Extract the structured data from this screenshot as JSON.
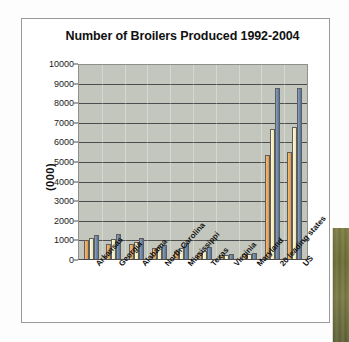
{
  "chart_data": {
    "type": "bar",
    "title": "Number of Broilers Produced 1992-2004",
    "xlabel": "",
    "ylabel": "(000)",
    "ylim": [
      0,
      10000
    ],
    "yticks": [
      0,
      1000,
      2000,
      3000,
      4000,
      5000,
      6000,
      7000,
      8000,
      9000,
      10000
    ],
    "ytick_labels": [
      "0",
      "1000",
      "2000",
      "3000",
      "4000",
      "5000",
      "6000",
      "7000",
      "8000",
      "9000",
      "10000"
    ],
    "grid": true,
    "legend": false,
    "legend_position": "none",
    "categories": [
      "Arkansas",
      "Georgia",
      "Alabama",
      "North Carolina",
      "Mississippi",
      "Texas",
      "Virginia",
      "Maryland",
      "20 leading states",
      "US"
    ],
    "series": [
      {
        "name": "1992",
        "color": "#e9a75c",
        "values": [
          950,
          780,
          760,
          540,
          420,
          310,
          190,
          240,
          5330,
          5450
        ]
      },
      {
        "name": "1998",
        "color": "#f4efc2",
        "values": [
          1060,
          1020,
          870,
          590,
          580,
          390,
          200,
          250,
          6630,
          6750
        ]
      },
      {
        "name": "2004",
        "color": "#6b85a8",
        "values": [
          1230,
          1300,
          1070,
          730,
          830,
          620,
          270,
          290,
          8730,
          8740
        ]
      }
    ]
  },
  "page": {
    "background_color": "#fdfdfd",
    "card_border_color": "#9a9a9a",
    "plot_background_color": "#c3c6bd",
    "gridline_color": "#4d4d4d",
    "strip_color": "#6e7038"
  }
}
